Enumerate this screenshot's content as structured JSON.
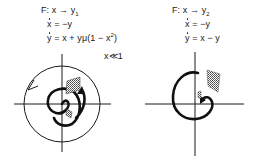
{
  "left_panel": {
    "mapping": "F: x → y",
    "mapping_sub": "1",
    "eq1_lhs": "x",
    "eq1_rhs": " = −y",
    "eq2_lhs": "y",
    "eq2_rhs_pre": " = x + yμ(1 − x",
    "eq2_sup": "2",
    "eq2_rhs_post": ")",
    "condition": "x≪1",
    "features": [
      "limit cycle circle with counter-clockwise arrow",
      "outward spiral with arrow",
      "small shaded patch near origin",
      "larger shaded patch after mapping"
    ]
  },
  "right_panel": {
    "mapping": "F: x → y",
    "mapping_sub": "2",
    "eq1_lhs": "x",
    "eq1_rhs": " = −y",
    "eq2_lhs": "y",
    "eq2_rhs": " = x − y",
    "features": [
      "inward spiral with arrow",
      "small shaded patch near origin",
      "larger shaded patch"
    ]
  },
  "colors": {
    "ink": "#1a1a1a",
    "background": "#ffffff",
    "hatch": "#555555"
  }
}
